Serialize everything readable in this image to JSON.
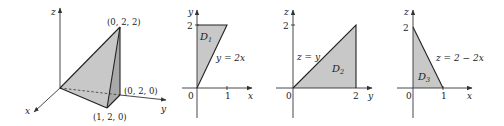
{
  "figure": {
    "panels": [
      {
        "id": "solid",
        "type": "3d-tetrahedron",
        "axes": {
          "x": "x",
          "y": "y",
          "z": "z"
        },
        "vertices": [
          {
            "coord": "(0, 2, 2)",
            "point": [
              0,
              2,
              2
            ]
          },
          {
            "coord": "(0, 2, 0)",
            "point": [
              0,
              2,
              0
            ]
          },
          {
            "coord": "(1, 2, 0)",
            "point": [
              1,
              2,
              0
            ]
          },
          {
            "coord": "",
            "point": [
              0,
              0,
              0
            ]
          }
        ]
      },
      {
        "id": "D1",
        "region_label": "D",
        "region_sub": "1",
        "h_axis": "x",
        "v_axis": "y",
        "origin_label": "0",
        "h_tick": "1",
        "v_tick": "2",
        "curve_label": "y = 2x",
        "vertices": [
          [
            0,
            0
          ],
          [
            0,
            2
          ],
          [
            1,
            2
          ]
        ]
      },
      {
        "id": "D2",
        "region_label": "D",
        "region_sub": "2",
        "h_axis": "y",
        "v_axis": "z",
        "origin_label": "0",
        "h_tick": "2",
        "v_tick": "2",
        "curve_label": "z = y",
        "vertices": [
          [
            0,
            0
          ],
          [
            2,
            2
          ],
          [
            2,
            0
          ]
        ]
      },
      {
        "id": "D3",
        "region_label": "D",
        "region_sub": "3",
        "h_axis": "x",
        "v_axis": "z",
        "origin_label": "0",
        "h_tick": "1",
        "v_tick": "2",
        "curve_label": "z = 2 − 2x",
        "vertices": [
          [
            0,
            0
          ],
          [
            0,
            2
          ],
          [
            1,
            0
          ]
        ]
      }
    ]
  }
}
